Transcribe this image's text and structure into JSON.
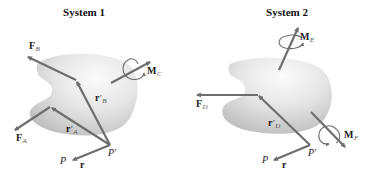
{
  "colors": {
    "arrow": "#6e6e6e",
    "blob_dark": "#bdbdbd",
    "blob_light": "#f2f2f2",
    "text": "#1a1a1a",
    "subscript": "#555555"
  },
  "systems": [
    {
      "title": "System 1",
      "labels": {
        "F_B": {
          "main": "F",
          "sub": "B"
        },
        "F_A": {
          "main": "F",
          "sub": "A"
        },
        "r_prime_B": {
          "main": "r",
          "prime": "′",
          "sub": "B"
        },
        "r_prime_A": {
          "main": "r",
          "prime": "′",
          "sub": "A"
        },
        "M_C": {
          "main": "M",
          "sub": "C"
        },
        "P": "P",
        "P_prime": "P′",
        "r": "r"
      }
    },
    {
      "title": "System 2",
      "labels": {
        "F_D": {
          "main": "F",
          "sub": "D"
        },
        "r_prime_D": {
          "main": "r",
          "prime": "′",
          "sub": "D"
        },
        "M_E": {
          "main": "M",
          "sub": "E"
        },
        "M_F": {
          "main": "M",
          "sub": "F"
        },
        "P": "P",
        "P_prime": "P′",
        "r": "r"
      }
    }
  ]
}
